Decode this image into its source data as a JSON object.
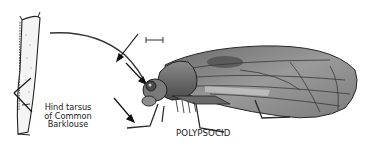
{
  "figure": {
    "labels": {
      "species": "POLYPSOCID",
      "inset_caption": [
        "Hind tarsus",
        "of Common",
        "Barklouse"
      ]
    },
    "annotations": {
      "arrows_count": 3,
      "inset_pointer_lines": 2,
      "scale_bar": true
    },
    "colors": {
      "ink": "#1a1a1a",
      "wing_shade": "#7a7a7a",
      "body_shade": "#5c5c5c",
      "background": "#ffffff"
    }
  }
}
